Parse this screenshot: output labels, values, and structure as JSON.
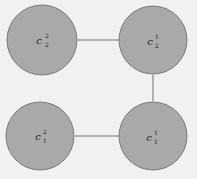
{
  "diagram": {
    "background": "#f1f1ef",
    "node_fill": "#a9a9a9",
    "node_stroke": "#7a7a7a",
    "edge_color": "#6f6f6f",
    "nodes": [
      {
        "id": "c22",
        "base": "c",
        "sup": "2",
        "sub": "2",
        "position": "top-left"
      },
      {
        "id": "c12",
        "base": "c",
        "sup": "1",
        "sub": "2",
        "position": "top-right"
      },
      {
        "id": "c21",
        "base": "c",
        "sup": "2",
        "sub": "1",
        "position": "bottom-left"
      },
      {
        "id": "c11",
        "base": "c",
        "sup": "1",
        "sub": "1",
        "position": "bottom-right"
      }
    ],
    "edges": [
      {
        "from": "c22",
        "to": "c12"
      },
      {
        "from": "c12",
        "to": "c11"
      },
      {
        "from": "c21",
        "to": "c11"
      }
    ]
  }
}
